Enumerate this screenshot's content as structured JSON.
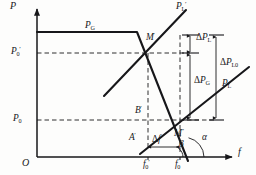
{
  "figure": {
    "kind": "engineering-line-diagram",
    "caption_absent": true,
    "axes": {
      "y_label": "P",
      "x_label": "f",
      "origin_label": "O"
    },
    "y_ticks": [
      {
        "id": "p0prime",
        "label_base": "P",
        "label_sub": "0",
        "label_prime": "′",
        "y": 53
      },
      {
        "id": "p0",
        "label_base": "P",
        "label_sub": "0",
        "label_prime": "",
        "y": 120
      }
    ],
    "x_ticks": [
      {
        "id": "f0prime",
        "label_base": "f",
        "label_sub": "0",
        "label_prime": "′",
        "x": 148
      },
      {
        "id": "f0",
        "label_base": "f",
        "label_sub": "0",
        "label_prime": "",
        "x": 180
      }
    ],
    "curve_labels": [
      {
        "id": "pg",
        "base": "P",
        "sub": "G",
        "prime": "",
        "x": 85,
        "y": 26
      },
      {
        "id": "plprime",
        "base": "P",
        "sub": "L",
        "prime": "′",
        "x": 176,
        "y": 5
      },
      {
        "id": "pl",
        "base": "P",
        "sub": "L",
        "prime": "",
        "x": 222,
        "y": 84
      }
    ],
    "point_labels": [
      {
        "id": "mprime",
        "base": "M",
        "sub": "",
        "prime": "′",
        "x": 147,
        "y": 38
      },
      {
        "id": "bprime",
        "base": "B",
        "sub": "",
        "prime": "′",
        "x": 138,
        "y": 110
      },
      {
        "id": "aprime",
        "base": "A",
        "sub": "",
        "prime": "′",
        "x": 132,
        "y": 137
      },
      {
        "id": "mdprime",
        "base": "M",
        "sub": "",
        "prime": "″",
        "x": 176,
        "y": 133
      }
    ],
    "delta_labels": [
      {
        "id": "dpl",
        "delta": "Δ",
        "base": "P",
        "sub": "L",
        "x": 196,
        "y": 36
      },
      {
        "id": "dpg",
        "delta": "Δ",
        "base": "P",
        "sub": "G",
        "x": 194,
        "y": 80
      },
      {
        "id": "dpl0",
        "delta": "Δ",
        "base": "P",
        "sub": "L0",
        "x": 221,
        "y": 62
      },
      {
        "id": "df",
        "delta": "Δ",
        "base": "f",
        "sub": "",
        "x": 152,
        "y": 139
      }
    ],
    "angle_labels": [
      {
        "id": "beta",
        "glyph": "β",
        "x": 180,
        "y": 143
      },
      {
        "id": "alpha",
        "glyph": "α",
        "x": 203,
        "y": 137
      }
    ],
    "colors": {
      "ink": "#17171a",
      "paper": "#fdfdfc",
      "ghost": "#e9e7e6"
    },
    "geometry": {
      "axis_y_x": 37,
      "axis_x_y": 157,
      "pg_flat_y": 32,
      "pg_flat_x_start": 37,
      "pg_break_x": 137,
      "pg_drop_to": {
        "x": 188,
        "y": 160
      },
      "pl_prime_line": {
        "x1": 104,
        "y1": 96,
        "x2": 183,
        "y2": 12
      },
      "pl_line": {
        "x1": 141,
        "y1": 153,
        "x2": 248,
        "y2": 68
      },
      "dashed_p0prime_y": 53,
      "dashed_p0_y": 120,
      "dashed_f0prime_x": 148,
      "dashed_f0_x": 180
    },
    "ghost_text": [
      {
        "t": "　　　　　",
        "x": 40,
        "y": 8
      },
      {
        "t": "　　　　　　",
        "x": 18,
        "y": 46
      },
      {
        "t": "　　　　　",
        "x": 18,
        "y": 62
      }
    ]
  }
}
